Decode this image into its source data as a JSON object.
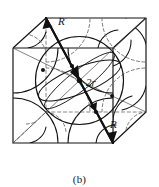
{
  "figure": {
    "caption": "(b)",
    "kind": "body-centered-cubic-unit-cell",
    "labels": {
      "corner_radius_top": "R",
      "corner_radius_bottom": "R",
      "body_diagonal": "2r"
    },
    "colors": {
      "stroke": "#111111",
      "hidden_stroke": "#6b6b6b",
      "thin_stroke": "#3a3a3a",
      "background": "#ffffff"
    },
    "geometry": {
      "cube_front_face": [
        [
          13,
          48
        ],
        [
          113,
          48
        ],
        [
          113,
          143
        ],
        [
          13,
          143
        ]
      ],
      "cube_back_face": [
        [
          46,
          18
        ],
        [
          146,
          18
        ],
        [
          146,
          112
        ],
        [
          46,
          112
        ]
      ],
      "body_diagonal_endpoints": [
        [
          46,
          18
        ],
        [
          113,
          143
        ]
      ],
      "center_point": [
        79.5,
        80.5
      ],
      "sphere_center_radius_px": 44
    }
  }
}
